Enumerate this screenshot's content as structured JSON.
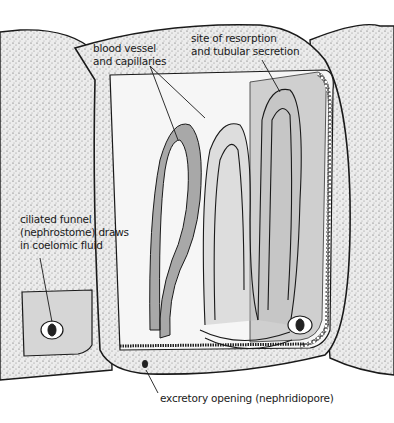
{
  "figure": {
    "labels": {
      "blood_vessel": [
        "blood vessel",
        "and capillaries"
      ],
      "resorption": [
        "site of resorption",
        "and tubular secretion"
      ],
      "funnel": [
        "ciliated funnel",
        "(nephrostome) draws",
        "in coelomic fluid"
      ],
      "pore": "excretory opening (nephridiopore)"
    },
    "colors": {
      "ink": "#1a1a1a",
      "stipple_body": "#d9d9d9",
      "coelom_fill": "#f4f4f4",
      "tubule_grey": "#a8a8a8",
      "gland_grey": "#cfcfcf"
    }
  }
}
